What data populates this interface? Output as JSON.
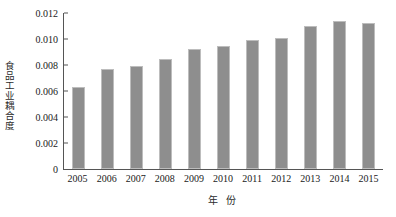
{
  "chart_data": {
    "type": "bar",
    "title": "",
    "xlabel": "年 份",
    "ylabel": "食品工业耦合度",
    "categories": [
      "2005",
      "2006",
      "2007",
      "2008",
      "2009",
      "2010",
      "2011",
      "2012",
      "2013",
      "2014",
      "2015"
    ],
    "values": [
      0.0063,
      0.0077,
      0.0079,
      0.0085,
      0.0092,
      0.0095,
      0.0099,
      0.0101,
      0.011,
      0.0114,
      0.0112
    ],
    "series": [
      {
        "name": "食品工业耦合度",
        "values": [
          0.0063,
          0.0077,
          0.0079,
          0.0085,
          0.0092,
          0.0095,
          0.0099,
          0.0101,
          0.011,
          0.0114,
          0.0112
        ]
      }
    ],
    "ylim": [
      0,
      0.012
    ],
    "yticks": [
      "0",
      "0.002",
      "0.004",
      "0.006",
      "0.008",
      "0.010",
      "0.012"
    ],
    "ytick_values": [
      0,
      0.002,
      0.004,
      0.006,
      0.008,
      0.01,
      0.012
    ],
    "grid": false,
    "legend": "none",
    "bar_color": "#8e8e8e",
    "axis_color": "#555555"
  }
}
